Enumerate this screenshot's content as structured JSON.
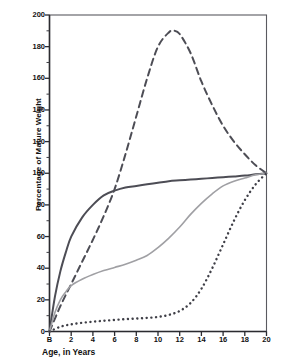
{
  "chart_data": {
    "type": "line",
    "title": "",
    "xlabel": "Age, in Years",
    "ylabel": "Percentage of Mature Weight",
    "xlim": [
      0,
      20
    ],
    "ylim": [
      0,
      200
    ],
    "grid": false,
    "legend": "none",
    "x_tick_labels": [
      "B",
      "2",
      "4",
      "6",
      "8",
      "10",
      "12",
      "14",
      "16",
      "18",
      "20"
    ],
    "x_tick_values": [
      0,
      2,
      4,
      6,
      8,
      10,
      12,
      14,
      16,
      18,
      20
    ],
    "y_tick_labels": [
      "0",
      "20",
      "40",
      "60",
      "80",
      "100",
      "120",
      "140",
      "160",
      "180",
      "200"
    ],
    "y_tick_values": [
      0,
      20,
      40,
      60,
      80,
      100,
      120,
      140,
      160,
      180,
      200
    ],
    "y_minor_tick_step": 10,
    "series": [
      {
        "name": "neural-type-curve",
        "style": "solid",
        "color": "#4d4d55",
        "width": 2.0,
        "x": [
          0,
          0.5,
          1,
          1.5,
          2,
          3,
          4,
          5,
          6,
          7,
          8,
          9,
          10,
          11,
          12,
          13,
          14,
          15,
          16,
          17,
          18,
          19,
          20
        ],
        "y": [
          0,
          22,
          38,
          50,
          60,
          72,
          80,
          86,
          89,
          91,
          92,
          93,
          94,
          95,
          95.5,
          96,
          96.5,
          97,
          97.5,
          98,
          98.5,
          99.3,
          100
        ]
      },
      {
        "name": "lymphoid-type-curve",
        "style": "dashed",
        "color": "#4d4d55",
        "width": 2.0,
        "x": [
          0,
          1,
          2,
          3,
          4,
          5,
          6,
          7,
          8,
          9,
          10,
          11,
          11.5,
          12,
          13,
          14,
          15,
          16,
          17,
          18,
          19,
          20
        ],
        "y": [
          0,
          16,
          30,
          44,
          58,
          73,
          90,
          112,
          136,
          160,
          180,
          189,
          190,
          188,
          176,
          158,
          143,
          130,
          120,
          112,
          105,
          100
        ]
      },
      {
        "name": "general-skeletal-type-curve",
        "style": "solid",
        "color": "#a0a0a4",
        "width": 1.6,
        "x": [
          0,
          0.5,
          1,
          1.5,
          2,
          3,
          4,
          5,
          6,
          7,
          8,
          9,
          10,
          11,
          12,
          13,
          14,
          15,
          16,
          17,
          18,
          19,
          20
        ],
        "y": [
          0,
          12,
          20,
          25,
          29,
          33,
          36,
          38.5,
          40.5,
          42.5,
          45,
          48,
          53,
          59,
          66,
          74,
          81,
          87,
          92,
          95,
          97,
          99,
          100
        ]
      },
      {
        "name": "genital-type-curve",
        "style": "dotted",
        "color": "#3f3f47",
        "width": 2.4,
        "x": [
          0,
          1,
          2,
          3,
          4,
          5,
          6,
          7,
          8,
          9,
          10,
          11,
          12,
          13,
          14,
          15,
          16,
          17,
          18,
          19,
          20
        ],
        "y": [
          0,
          3,
          4.5,
          5.5,
          6.2,
          6.8,
          7.3,
          7.8,
          8.2,
          8.6,
          9.2,
          10.5,
          13,
          18,
          27,
          40,
          55,
          70,
          83,
          93,
          100
        ]
      }
    ]
  }
}
